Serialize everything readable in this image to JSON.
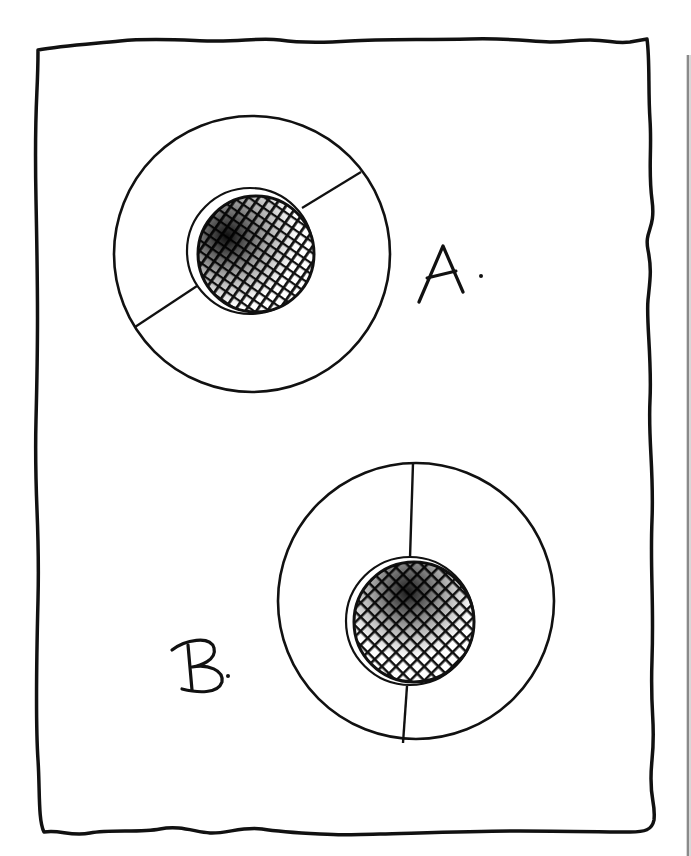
{
  "figure": {
    "background": "#ffffff",
    "ink": "#111111",
    "edge_strip_color": "#9a9a9a",
    "frame": {
      "description": "Hand-drawn wavy rectangular border"
    },
    "diagrams": [
      {
        "id": "A",
        "label": "A.",
        "description": "Large circle with a small cross-hatched dark disc near center; a straight line passes diagonally through the circle, from lower-left to upper-right, interrupted by the inner disc",
        "line_orientation": "diagonal"
      },
      {
        "id": "B",
        "label": "B.",
        "description": "Large circle with a small cross-hatched dark disc below center; a nearly vertical line passes through the circle from top to bottom, interrupted by the inner disc",
        "line_orientation": "vertical"
      }
    ]
  }
}
